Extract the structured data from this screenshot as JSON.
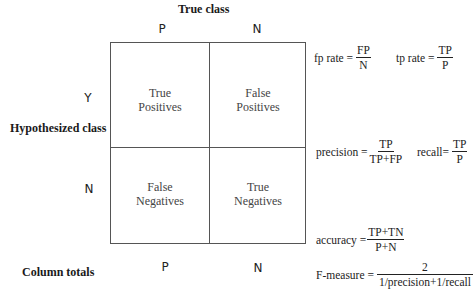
{
  "title": "True class",
  "columns": {
    "header_p": "P",
    "header_n": "N"
  },
  "rows": {
    "label": "Hypothesized class",
    "row_y": "Y",
    "row_n": "N"
  },
  "matrix": {
    "tp": {
      "line1": "True",
      "line2": "Positives"
    },
    "fp": {
      "line1": "False",
      "line2": "Positives"
    },
    "fn": {
      "line1": "False",
      "line2": "Negatives"
    },
    "tn": {
      "line1": "True",
      "line2": "Negatives"
    }
  },
  "column_totals": {
    "label": "Column totals",
    "p": "P",
    "n": "N"
  },
  "formulas": {
    "fp_rate": {
      "label": "fp rate =",
      "numerator": "FP",
      "denominator": "N"
    },
    "tp_rate": {
      "label": "tp rate =",
      "numerator": "TP",
      "denominator": "P"
    },
    "precision": {
      "label": "precision =",
      "numerator": "TP",
      "denominator": "TP+FP"
    },
    "recall": {
      "label": "recall=",
      "numerator": "TP",
      "denominator": "P"
    },
    "accuracy": {
      "label": "accuracy =",
      "numerator": "TP+TN",
      "denominator": "P+N"
    },
    "f_measure": {
      "label": "F-measure =",
      "numerator": "2",
      "denominator": "1/precision+1/recall"
    }
  }
}
